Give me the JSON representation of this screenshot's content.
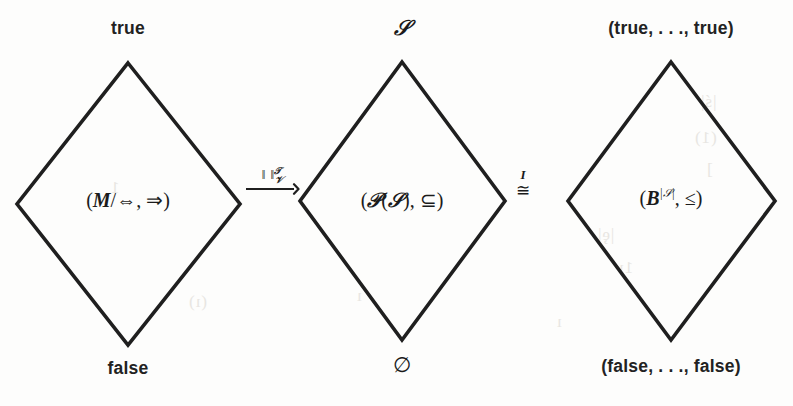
{
  "figure": {
    "background_color": "#fdfdfc",
    "ink_color": "#1a1a1a",
    "width": 793,
    "height": 406
  },
  "lattices": [
    {
      "id": "formula-lattice",
      "top_label": "true",
      "bottom_label": "false",
      "center_open_paren": "(",
      "center_main": "M",
      "center_slash": "/",
      "center_equiv": "⇔",
      "center_comma": ", ",
      "center_order": "⇒",
      "center_close_paren": ")",
      "center_plain": "(M/⇔, ⇒)",
      "geometry": {
        "left_x": 17,
        "right_x": 240,
        "top_y": 63,
        "bottom_y": 345,
        "cx": 128,
        "cy": 204
      }
    },
    {
      "id": "powerset-lattice",
      "top_label": "𝒮",
      "bottom_label": "∅",
      "center_open_paren": "(",
      "center_powerset": "𝒫",
      "center_arg_open": "(",
      "center_arg": "𝒮",
      "center_arg_close": ")",
      "center_comma": ", ",
      "center_order": "⊆",
      "center_close_paren": ")",
      "center_plain": "(𝒫(𝒮), ⊆)",
      "geometry": {
        "left_x": 300,
        "right_x": 505,
        "top_y": 62,
        "bottom_y": 340,
        "cx": 402,
        "cy": 201
      }
    },
    {
      "id": "boolean-vector-lattice",
      "top_label": "(true, . . ., true)",
      "bottom_label": "(false, . . ., false)",
      "center_open_paren": "(",
      "center_base": "B",
      "center_exponent": "|𝒮|",
      "center_comma": ", ",
      "center_order": "≤",
      "center_close_paren": ")",
      "center_plain": "(𝔹^|𝒮|, ≤)",
      "geometry": {
        "left_x": 568,
        "right_x": 775,
        "top_y": 62,
        "bottom_y": 340,
        "cx": 671,
        "cy": 201
      }
    }
  ],
  "connectors": [
    {
      "id": "valuation-map",
      "kind": "long-rightarrow-with-label",
      "bars": "‖ ‖",
      "superscript": "𝒯",
      "subscript": "𝒱",
      "arrow_glyph": "⟶",
      "plain": "‖ ‖ superscript T subscript V",
      "x": 248,
      "y": 168
    },
    {
      "id": "isomorphism-map",
      "kind": "congruence",
      "top_symbol": "I",
      "symbol": "≅",
      "plain": "≅ with I above",
      "x": 516,
      "y": 170
    }
  ],
  "bleed_through": [
    {
      "text": "|ś|",
      "x": 700,
      "y": 92
    },
    {
      "text": "(1)",
      "x": 694,
      "y": 128
    },
    {
      "text": "]",
      "x": 706,
      "y": 160
    },
    {
      "text": "|ȩ|",
      "x": 597,
      "y": 225
    },
    {
      "text": "1ı",
      "x": 618,
      "y": 258
    },
    {
      "text": "ı",
      "x": 556,
      "y": 312
    },
    {
      "text": "(ı)",
      "x": 188,
      "y": 292
    },
    {
      "text": "1",
      "x": 110,
      "y": 178
    },
    {
      "text": "ı",
      "x": 356,
      "y": 286
    }
  ]
}
